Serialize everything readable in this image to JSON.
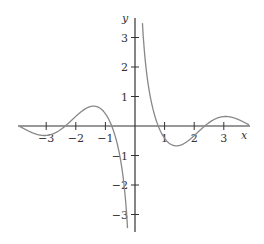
{
  "chart_data": {
    "type": "line",
    "title": "",
    "xlabel": "x",
    "ylabel": "y",
    "function": "cos(2x)/x",
    "xlim": [
      -3.95,
      3.85
    ],
    "ylim": [
      -3.5,
      3.6
    ],
    "grid": false,
    "x_ticks": [
      -3,
      -2,
      -1,
      1,
      2,
      3
    ],
    "x_tick_labels": [
      "−3",
      "−2",
      "−1",
      "1",
      "2",
      "3"
    ],
    "y_ticks": [
      -3,
      -2,
      -1,
      1,
      2,
      3
    ],
    "y_tick_labels": [
      "−3",
      "−2",
      "−1",
      "1",
      "2",
      "3"
    ],
    "series": [
      {
        "name": "left branch",
        "x_range": [
          -3.9,
          -0.14
        ]
      },
      {
        "name": "right branch",
        "x_range": [
          0.14,
          3.85
        ]
      }
    ],
    "key_points": {
      "zeros": [
        -3.93,
        -2.36,
        -0.785,
        0.785,
        2.36,
        3.93
      ],
      "local_max": [
        [
          -1.35,
          0.67
        ],
        [
          3.0,
          0.32
        ]
      ],
      "local_min": [
        [
          -3.0,
          -0.32
        ],
        [
          1.35,
          -0.67
        ]
      ],
      "vertical_asymptote": 0
    },
    "colors": {
      "axes": "#333333",
      "curve": "#888888"
    }
  }
}
